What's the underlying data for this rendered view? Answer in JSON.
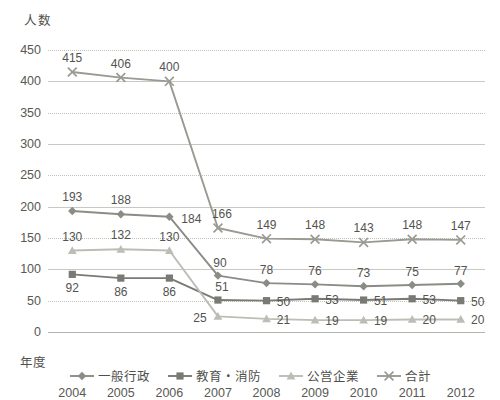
{
  "axes": {
    "y_title": "人数",
    "x_title": "年度",
    "y_ticks": [
      "0",
      "50",
      "100",
      "150",
      "200",
      "250",
      "300",
      "350",
      "400",
      "450"
    ]
  },
  "legend": {
    "items": [
      {
        "label": "一般行政",
        "marker": "diamond-marker",
        "color": "#8c8c86"
      },
      {
        "label": "教育・消防",
        "marker": "square-marker",
        "color": "#7a7a74"
      },
      {
        "label": "公営企業",
        "marker": "triangle-marker",
        "color": "#bdbdb6"
      },
      {
        "label": "合計",
        "marker": "x-cross-marker",
        "color": "#9a9a93"
      }
    ]
  },
  "chart_data": {
    "type": "line",
    "title": "",
    "xlabel": "年度",
    "ylabel": "人数",
    "ylim": [
      0,
      450
    ],
    "ytick_step": 50,
    "grid": true,
    "legend_position": "bottom",
    "categories": [
      "2004",
      "2005",
      "2006",
      "2007",
      "2008",
      "2009",
      "2010",
      "2011",
      "2012"
    ],
    "series": [
      {
        "name": "一般行政",
        "color": "#8c8c86",
        "marker": "diamond",
        "values": [
          193,
          188,
          184,
          90,
          78,
          76,
          73,
          75,
          77
        ],
        "label_offsets": [
          {
            "dx": 0,
            "dy": -14
          },
          {
            "dx": 0,
            "dy": -14
          },
          {
            "dx": 22,
            "dy": 2
          },
          {
            "dx": 2,
            "dy": -13
          },
          {
            "dx": 0,
            "dy": -13
          },
          {
            "dx": 0,
            "dy": -13
          },
          {
            "dx": 0,
            "dy": -13
          },
          {
            "dx": 0,
            "dy": -13
          },
          {
            "dx": 0,
            "dy": -13
          }
        ]
      },
      {
        "name": "教育・消防",
        "color": "#7a7a74",
        "marker": "square",
        "values": [
          92,
          86,
          86,
          51,
          50,
          53,
          51,
          53,
          50
        ],
        "label_offsets": [
          {
            "dx": 0,
            "dy": 14
          },
          {
            "dx": 0,
            "dy": 14
          },
          {
            "dx": 0,
            "dy": 14
          },
          {
            "dx": 4,
            "dy": -13
          },
          {
            "dx": 17,
            "dy": 1
          },
          {
            "dx": 17,
            "dy": 1
          },
          {
            "dx": 17,
            "dy": 1
          },
          {
            "dx": 17,
            "dy": 1
          },
          {
            "dx": 17,
            "dy": 1
          }
        ]
      },
      {
        "name": "公営企業",
        "color": "#bdbdb6",
        "marker": "triangle",
        "values": [
          130,
          132,
          130,
          25,
          21,
          19,
          19,
          20,
          20
        ],
        "label_offsets": [
          {
            "dx": 0,
            "dy": -14
          },
          {
            "dx": 0,
            "dy": -14
          },
          {
            "dx": 0,
            "dy": -14
          },
          {
            "dx": -18,
            "dy": 2
          },
          {
            "dx": 17,
            "dy": 1
          },
          {
            "dx": 17,
            "dy": 1
          },
          {
            "dx": 17,
            "dy": 1
          },
          {
            "dx": 17,
            "dy": 1
          },
          {
            "dx": 17,
            "dy": 1
          }
        ]
      },
      {
        "name": "合計",
        "color": "#9a9a93",
        "marker": "x-cross",
        "values": [
          415,
          406,
          400,
          166,
          149,
          148,
          143,
          148,
          147
        ],
        "label_offsets": [
          {
            "dx": 0,
            "dy": -14
          },
          {
            "dx": 0,
            "dy": -14
          },
          {
            "dx": 0,
            "dy": -14
          },
          {
            "dx": 4,
            "dy": -14
          },
          {
            "dx": 0,
            "dy": -14
          },
          {
            "dx": 0,
            "dy": -14
          },
          {
            "dx": 0,
            "dy": -14
          },
          {
            "dx": 0,
            "dy": -14
          },
          {
            "dx": 0,
            "dy": -14
          }
        ]
      }
    ]
  }
}
